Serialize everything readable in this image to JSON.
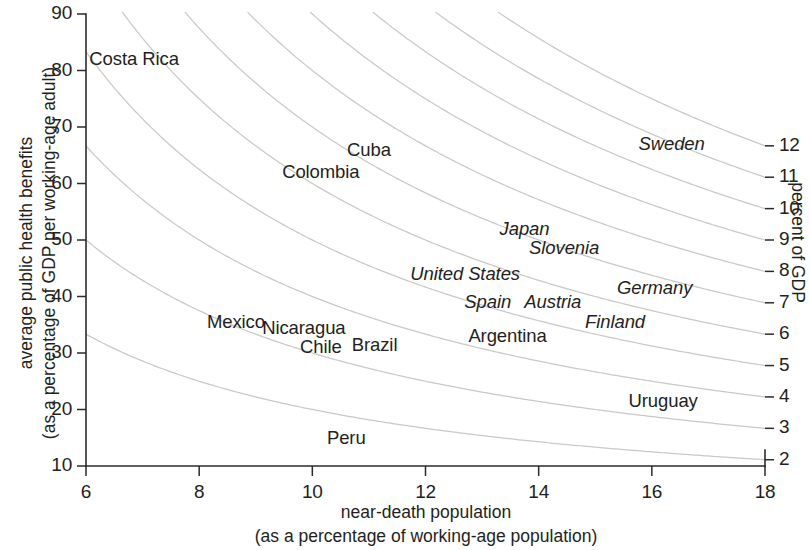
{
  "chart_data": {
    "type": "scatter",
    "title": "",
    "xlabel": "near-death population",
    "xlabel_sub": "(as a percentage of working-age population)",
    "ylabel": "average public health benefits",
    "ylabel_sub": "(as a percentage of GDP per working-age adult)",
    "y2label": "percent of GDP",
    "xlim": [
      6,
      18
    ],
    "ylim": [
      10,
      90
    ],
    "y2lim": [
      2,
      12
    ],
    "xticks": [
      6,
      8,
      10,
      12,
      14,
      16,
      18
    ],
    "yticks": [
      10,
      20,
      30,
      40,
      50,
      60,
      70,
      80,
      90
    ],
    "y2ticks": [
      2,
      3,
      4,
      5,
      6,
      7,
      8,
      9,
      10,
      11,
      12
    ],
    "grid": false,
    "legend": "none",
    "curve_relation": "y = 100 * c / x, where c is the percent-of-GDP contour value",
    "curve_values": [
      2,
      3,
      4,
      5,
      6,
      7,
      8,
      9,
      10,
      11,
      12
    ],
    "curve_color": "#c9c9c9",
    "label_color": "#231f20",
    "points": [
      {
        "name": "Costa Rica",
        "x": 6.85,
        "y": 82.0,
        "style": "upright"
      },
      {
        "name": "Cuba",
        "x": 11.0,
        "y": 66.0,
        "style": "upright"
      },
      {
        "name": "Colombia",
        "x": 10.15,
        "y": 62.0,
        "style": "upright"
      },
      {
        "name": "Sweden",
        "x": 16.35,
        "y": 67.0,
        "style": "italic"
      },
      {
        "name": "Japan",
        "x": 13.75,
        "y": 52.0,
        "style": "italic"
      },
      {
        "name": "Slovenia",
        "x": 14.45,
        "y": 48.5,
        "style": "italic"
      },
      {
        "name": "United States",
        "x": 12.7,
        "y": 44.0,
        "style": "italic"
      },
      {
        "name": "Germany",
        "x": 16.05,
        "y": 41.5,
        "style": "italic"
      },
      {
        "name": "Spain",
        "x": 13.1,
        "y": 39.0,
        "style": "italic"
      },
      {
        "name": "Austria",
        "x": 14.25,
        "y": 39.0,
        "style": "italic"
      },
      {
        "name": "Finland",
        "x": 15.35,
        "y": 35.5,
        "style": "italic"
      },
      {
        "name": "Mexico",
        "x": 8.65,
        "y": 35.5,
        "style": "upright"
      },
      {
        "name": "Nicaragua",
        "x": 9.85,
        "y": 34.5,
        "style": "upright"
      },
      {
        "name": "Argentina",
        "x": 13.45,
        "y": 33.0,
        "style": "upright"
      },
      {
        "name": "Chile",
        "x": 10.15,
        "y": 31.0,
        "style": "upright"
      },
      {
        "name": "Brazil",
        "x": 11.1,
        "y": 31.5,
        "style": "upright"
      },
      {
        "name": "Uruguay",
        "x": 16.2,
        "y": 21.5,
        "style": "upright"
      },
      {
        "name": "Peru",
        "x": 10.6,
        "y": 15.0,
        "style": "upright"
      }
    ]
  }
}
